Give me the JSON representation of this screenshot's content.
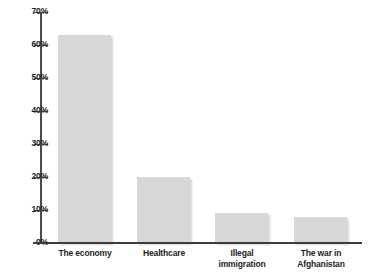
{
  "chart_data": {
    "type": "bar",
    "title": "",
    "xlabel": "",
    "ylabel": "",
    "ylim": [
      0,
      70
    ],
    "grid": false,
    "legend": false,
    "categories": [
      "The economy",
      "Healthcare",
      "Illegal immigration",
      "The war in Afghanistan"
    ],
    "category_lines": [
      [
        "The economy"
      ],
      [
        "Healthcare"
      ],
      [
        "Illegal",
        "immigration"
      ],
      [
        "The war in",
        "Afghanistan"
      ]
    ],
    "values": [
      63,
      20,
      9,
      8
    ],
    "y_ticks": [
      "0%",
      "10%",
      "20%",
      "30%",
      "40%",
      "50%",
      "60%",
      "70%"
    ],
    "y_tick_values": [
      0,
      10,
      20,
      30,
      40,
      50,
      60,
      70
    ],
    "colors": {
      "bar_fill": "#d7d7d7",
      "axis": "#4a4a4a",
      "text": "#231f20",
      "background": "#ffffff"
    }
  }
}
